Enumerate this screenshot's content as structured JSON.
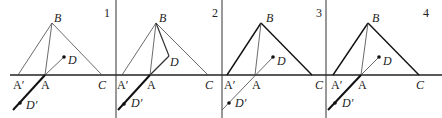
{
  "panels": [
    {
      "number": "1",
      "labels": {
        "B": "B",
        "D": "D",
        "A1": "A′",
        "A": "A",
        "C": "C",
        "D1": "D′"
      }
    },
    {
      "number": "2",
      "labels": {
        "B": "B",
        "D": "D",
        "A1": "A′",
        "A": "A",
        "C": "C",
        "D1": "D′"
      }
    },
    {
      "number": "3",
      "labels": {
        "B": "B",
        "D": "D",
        "A1": "A′",
        "A": "A",
        "C": "C",
        "D1": "D′"
      }
    },
    {
      "number": "4",
      "labels": {
        "B": "B",
        "D": "D",
        "A1": "A′",
        "A": "A",
        "C": "C",
        "D1": "D′"
      }
    }
  ],
  "colors": {
    "line": "#222222",
    "background": "#ffffff"
  }
}
